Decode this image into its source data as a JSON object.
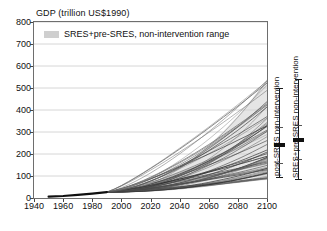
{
  "chart_data": {
    "type": "line",
    "title": "GDP (trillion US$1990)",
    "xlabel": "",
    "ylabel": "GDP (trillion US$1990)",
    "xlim": [
      1940,
      2100
    ],
    "ylim": [
      0,
      800
    ],
    "xticks": [
      1940,
      1960,
      1980,
      2000,
      2020,
      2040,
      2060,
      2080,
      2100
    ],
    "yticks": [
      0,
      100,
      200,
      300,
      400,
      500,
      600,
      700,
      800
    ],
    "grid": "horizontal",
    "legend": {
      "position": "top-left-inside",
      "entries": [
        {
          "label": "SRES+pre-SRES, non-intervention range",
          "swatch": "#cfcfcf"
        }
      ]
    },
    "historical": {
      "label": "historical GDP",
      "x": [
        1950,
        1960,
        1970,
        1980,
        1990
      ],
      "y": [
        6,
        9,
        14,
        20,
        27
      ]
    },
    "scenario_bundle": {
      "description": "Many non-intervention SRES and pre-SRES scenario trajectories, 1990-2100",
      "n_series": 58,
      "start_year": 1990,
      "end_year": 2100,
      "start_value": 27,
      "end_value_min": 82,
      "end_value_max": 540,
      "end_value_median": 265
    },
    "range_bars": [
      {
        "name": "post-SRES non-intervention",
        "label": "post-SRES non-intervention",
        "year": 2100,
        "min": 92,
        "max": 500,
        "median": 243,
        "q_low": 160,
        "q_high": 325
      },
      {
        "name": "SRES+pre-SRES non-intervention",
        "label": "SRES+pre-SRES non-intervention",
        "year": 2100,
        "min": 82,
        "max": 540,
        "median": 265,
        "q_low": 175,
        "q_high": 330
      }
    ],
    "colors": {
      "line": "#3a3a3a",
      "range_fill": "#cfcfcf",
      "grid": "#d6d6d6",
      "axis": "#6e6e6e",
      "historical": "#101010"
    }
  }
}
